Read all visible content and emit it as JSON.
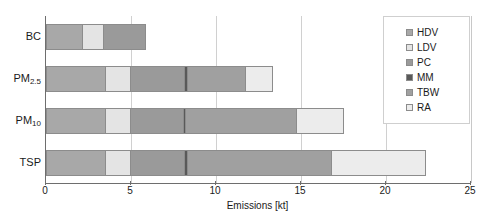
{
  "chart_data": {
    "type": "bar",
    "orientation": "horizontal",
    "stacked": true,
    "title": "",
    "xlabel": "Emissions [kt]",
    "ylabel": "",
    "xlim": [
      0,
      25
    ],
    "xticks": [
      0,
      5,
      10,
      15,
      20,
      25
    ],
    "xtick_labels": [
      "0",
      "5",
      "10",
      "15",
      "20",
      "25"
    ],
    "grid": "vertical",
    "legend_position": "right",
    "categories": [
      "BC",
      "PM2.5",
      "PM10",
      "TSP"
    ],
    "category_labels": [
      {
        "base": "BC",
        "sub": ""
      },
      {
        "base": "PM",
        "sub": "2.5"
      },
      {
        "base": "PM",
        "sub": "10"
      },
      {
        "base": "TSP",
        "sub": ""
      }
    ],
    "series": [
      {
        "name": "HDV",
        "color": "#a8a8a8",
        "values": [
          2.2,
          3.5,
          3.5,
          3.5
        ]
      },
      {
        "name": "LDV",
        "color": "#e4e4e4",
        "values": [
          1.2,
          1.5,
          1.5,
          1.5
        ]
      },
      {
        "name": "PC",
        "color": "#9a9a9a",
        "values": [
          2.5,
          3.2,
          3.1,
          3.2
        ]
      },
      {
        "name": "MM",
        "color": "#595959",
        "values": [
          0.0,
          0.15,
          0.15,
          0.15
        ]
      },
      {
        "name": "TBW",
        "color": "#a0a0a0",
        "values": [
          0.0,
          3.4,
          6.5,
          8.5
        ]
      },
      {
        "name": "RA",
        "color": "#ececec",
        "values": [
          0.0,
          1.6,
          2.8,
          5.5
        ]
      }
    ],
    "totals": [
      5.9,
      13.4,
      17.6,
      22.4
    ]
  },
  "legend": {
    "items": [
      {
        "label": "HDV"
      },
      {
        "label": "LDV"
      },
      {
        "label": "PC"
      },
      {
        "label": "MM"
      },
      {
        "label": "TBW"
      },
      {
        "label": "RA"
      }
    ]
  }
}
